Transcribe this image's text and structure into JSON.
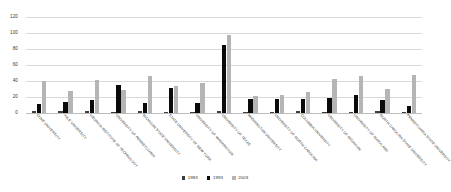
{
  "chart_data": {
    "type": "bar",
    "title": "",
    "xlabel": "",
    "ylabel": "",
    "ylim": [
      0,
      120
    ],
    "yticks": [
      0,
      20,
      40,
      60,
      80,
      100,
      120
    ],
    "grid": true,
    "legend_position": "bottom-center",
    "categories": [
      "DUKE UNIVERSITY",
      "YALE UNIVERSITY",
      "GEORGIA INSTITUTE OF TECHNOLOGY",
      "UNIVERSITY OF PENNSYLVANIA",
      "MICHIGAN STATE UNIVERSITY",
      "STATE UNIVERSITY OF NEW YORK",
      "UNIVERSITY OF WASHINGTON",
      "UNIVERSITY OF TEXAS",
      "WASHINGTON UNIVERSITY",
      "UNIVERSITY OF NORTH CAROLINA",
      "COLUMBIA UNIVERSITY",
      "UNIVERSITY OF MICHIGAN",
      "UNIVERSITY OF MARYLAND",
      "NORTH CAROLINA STATE UNIVERSITY",
      "PENNSYLVANIA STATE UNIVERSITY"
    ],
    "series": [
      {
        "name": "1983",
        "color": "#3d3d3d",
        "values": [
          2,
          2,
          3,
          1,
          2,
          1,
          1,
          3,
          1,
          1,
          2,
          1,
          1,
          3,
          1
        ]
      },
      {
        "name": "1993",
        "color": "#0a0a0a",
        "values": [
          11,
          14,
          16,
          35,
          13,
          31,
          12,
          85,
          17,
          17,
          18,
          19,
          23,
          16,
          9
        ]
      },
      {
        "name": "2003",
        "color": "#b5b5b5",
        "values": [
          40,
          27,
          41,
          29,
          46,
          34,
          37,
          97,
          21,
          22,
          26,
          43,
          46,
          30,
          48
        ]
      }
    ]
  },
  "legend": {
    "items": [
      {
        "label": "1983"
      },
      {
        "label": "1993"
      },
      {
        "label": "2003"
      }
    ]
  },
  "axis": {
    "y_tick_labels": [
      "120",
      "100",
      "80",
      "60",
      "40",
      "20",
      "0"
    ]
  }
}
